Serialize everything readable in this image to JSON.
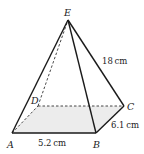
{
  "diagram": {
    "type": "square-based pyramid",
    "colors": {
      "stroke": "#1a1a1a",
      "base_fill": "#ececec",
      "background": "#ffffff"
    },
    "vertices": {
      "A": {
        "label": "A",
        "x": 12,
        "y": 133
      },
      "B": {
        "label": "B",
        "x": 96,
        "y": 133
      },
      "C": {
        "label": "C",
        "x": 124,
        "y": 106
      },
      "D": {
        "label": "D",
        "x": 38,
        "y": 106
      },
      "E": {
        "label": "E",
        "x": 68,
        "y": 20
      }
    },
    "measurements": {
      "AB": "5.2 cm",
      "BC": "6.1 cm",
      "EC": "18 cm"
    }
  }
}
